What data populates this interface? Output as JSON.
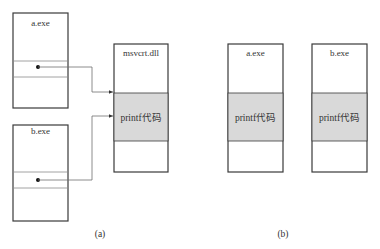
{
  "diagram": {
    "panel_a": {
      "caption": "(a)",
      "processes": [
        {
          "label": "a.exe"
        },
        {
          "label": "b.exe"
        }
      ],
      "shared_library": {
        "label": "msvcrt.dll",
        "code_label": "printf代码"
      }
    },
    "panel_b": {
      "caption": "(b)",
      "processes": [
        {
          "label": "a.exe",
          "code_label": "printf代码"
        },
        {
          "label": "b.exe",
          "code_label": "printf代码"
        }
      ]
    },
    "colors": {
      "shade": "#d9d9d9",
      "outline": "#3a3a3a",
      "text": "#333333"
    }
  }
}
